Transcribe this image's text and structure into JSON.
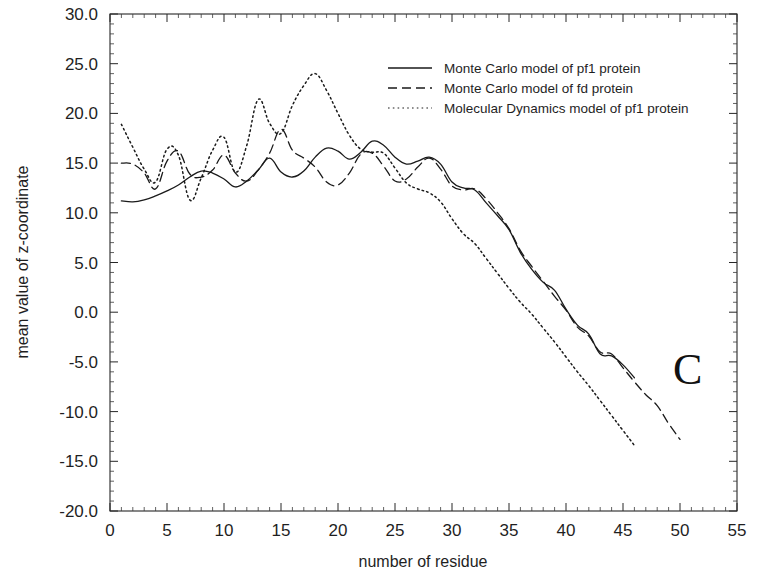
{
  "chart_data": {
    "type": "line",
    "title": "",
    "panel_label": "C",
    "xlabel": "number of residue",
    "ylabel": "mean value of z-coordinate",
    "xlim": [
      0,
      55
    ],
    "ylim": [
      -20.0,
      30.0
    ],
    "xticks": [
      0,
      5,
      10,
      15,
      20,
      25,
      30,
      35,
      40,
      45,
      50,
      55
    ],
    "xtick_labels": [
      "0",
      "5",
      "10",
      "15",
      "20",
      "25",
      "30",
      "35",
      "40",
      "45",
      "50",
      "55"
    ],
    "yticks": [
      -20.0,
      -15.0,
      -10.0,
      -5.0,
      0.0,
      5.0,
      10.0,
      15.0,
      20.0,
      25.0,
      30.0
    ],
    "ytick_labels": [
      "-20.0",
      "-15.0",
      "-10.0",
      "-5.0",
      "0.0",
      "5.0",
      "10.0",
      "15.0",
      "20.0",
      "25.0",
      "30.0"
    ],
    "minor_ticks_per_interval": 5,
    "grid": false,
    "legend_position": "top-right",
    "series": [
      {
        "name": "Monte Carlo model of pf1 protein",
        "style": "solid",
        "color": "#1a1a1a",
        "x": [
          1,
          2,
          3,
          4,
          5,
          6,
          7,
          8,
          9,
          10,
          11,
          12,
          13,
          14,
          15,
          16,
          17,
          18,
          19,
          20,
          21,
          22,
          23,
          24,
          25,
          26,
          27,
          28,
          29,
          30,
          31,
          32,
          33,
          34,
          35,
          36,
          37,
          38,
          39,
          40,
          41,
          42,
          43,
          44,
          45,
          46
        ],
        "values": [
          11.2,
          11.1,
          11.3,
          11.7,
          12.2,
          12.8,
          13.6,
          14.2,
          14.0,
          13.4,
          12.6,
          13.2,
          14.3,
          15.5,
          14.1,
          13.6,
          14.2,
          15.6,
          16.5,
          16.2,
          15.4,
          16.1,
          17.2,
          16.8,
          15.6,
          14.9,
          15.2,
          15.6,
          14.9,
          13.1,
          12.5,
          12.3,
          11.0,
          9.7,
          8.3,
          6.0,
          4.3,
          3.0,
          2.2,
          0.3,
          -1.3,
          -2.2,
          -4.2,
          -4.4,
          -5.3,
          -6.6
        ]
      },
      {
        "name": "Monte Carlo model of fd protein",
        "style": "dashed",
        "color": "#1a1a1a",
        "x": [
          1,
          2,
          3,
          4,
          5,
          6,
          7,
          8,
          9,
          10,
          11,
          12,
          13,
          14,
          15,
          16,
          17,
          18,
          19,
          20,
          21,
          22,
          23,
          24,
          25,
          26,
          27,
          28,
          29,
          30,
          31,
          32,
          33,
          34,
          35,
          36,
          37,
          38,
          39,
          40,
          41,
          42,
          43,
          44,
          45,
          46,
          47,
          48,
          49,
          50
        ],
        "values": [
          15.0,
          14.9,
          14.0,
          12.4,
          15.2,
          16.2,
          13.9,
          13.6,
          14.3,
          15.8,
          14.0,
          13.2,
          14.3,
          16.0,
          18.4,
          16.3,
          15.5,
          14.6,
          13.1,
          12.8,
          14.0,
          15.9,
          16.0,
          14.7,
          13.2,
          13.4,
          14.6,
          15.5,
          14.4,
          12.7,
          12.3,
          12.4,
          11.4,
          10.0,
          8.4,
          6.2,
          4.6,
          3.1,
          1.6,
          0.2,
          -1.5,
          -2.4,
          -4.0,
          -4.2,
          -5.6,
          -7.0,
          -8.3,
          -9.4,
          -11.2,
          -12.8
        ]
      },
      {
        "name": "Molecular Dynamics model of pf1 protein",
        "style": "dotted",
        "color": "#6a6a6a",
        "x": [
          1,
          2,
          3,
          4,
          5,
          6,
          7,
          8,
          9,
          10,
          11,
          12,
          13,
          14,
          15,
          16,
          17,
          18,
          19,
          20,
          21,
          22,
          23,
          24,
          25,
          26,
          27,
          28,
          29,
          30,
          31,
          32,
          33,
          34,
          35,
          36,
          37,
          38,
          39,
          40,
          41,
          42,
          43,
          44,
          45,
          46
        ],
        "values": [
          18.9,
          16.6,
          14.4,
          13.1,
          16.4,
          15.8,
          11.3,
          13.5,
          16.3,
          17.6,
          14.1,
          16.8,
          21.4,
          19.0,
          18.0,
          20.8,
          22.8,
          24.0,
          22.3,
          20.0,
          17.8,
          16.4,
          16.1,
          16.0,
          14.5,
          13.0,
          12.4,
          12.0,
          11.1,
          9.4,
          7.9,
          6.9,
          5.4,
          3.9,
          2.4,
          1.0,
          -0.2,
          -1.6,
          -3.0,
          -4.5,
          -6.0,
          -7.4,
          -8.9,
          -10.4,
          -11.9,
          -13.4
        ]
      }
    ]
  },
  "legend": {
    "entries": [
      {
        "label": "Monte Carlo model of pf1 protein",
        "style": "solid"
      },
      {
        "label": "Monte Carlo model of fd protein",
        "style": "dashed"
      },
      {
        "label": "Molecular Dynamics model of pf1 protein",
        "style": "dotted"
      }
    ]
  }
}
